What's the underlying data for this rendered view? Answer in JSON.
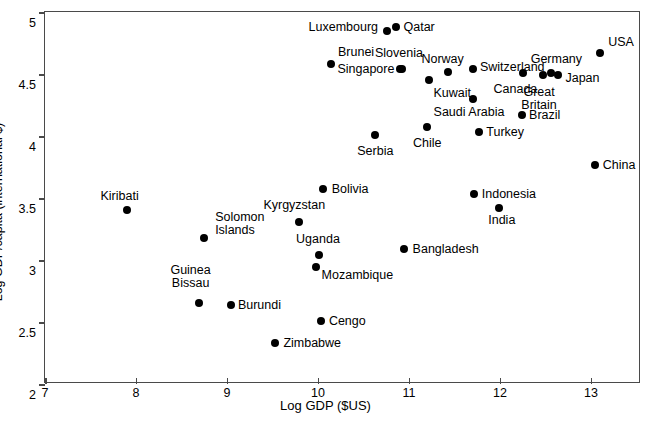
{
  "chart_data": {
    "type": "scatter",
    "title": "",
    "xlabel": "Log GDP ($US)",
    "ylabel": "Log GDP/capita (international $)",
    "xlim": [
      7,
      13.55
    ],
    "ylim": [
      2,
      5
    ],
    "xticks": [
      "7",
      "8",
      "9",
      "10",
      "11",
      "12",
      "13"
    ],
    "xtick_values": [
      7,
      8,
      9,
      10,
      11,
      12,
      13
    ],
    "yticks": [
      "2",
      "2.5",
      "3",
      "3.5",
      "4",
      "4.5",
      "5"
    ],
    "ytick_values": [
      2,
      2.5,
      3,
      3.5,
      4,
      4.5,
      5
    ],
    "grid": false,
    "legend": false,
    "marker_color": "#000000",
    "points": [
      {
        "label": "Kiribati",
        "x": 7.9,
        "y": 3.4,
        "lx": 7.82,
        "ly": 3.52,
        "align": "c"
      },
      {
        "label": "Guinea\nBissau",
        "x": 8.69,
        "y": 2.65,
        "lx": 8.6,
        "ly": 2.86,
        "align": "c"
      },
      {
        "label": "Solomon\nIslands",
        "x": 8.75,
        "y": 3.18,
        "lx": 8.87,
        "ly": 3.29,
        "align": "r"
      },
      {
        "label": "Burundi",
        "x": 9.04,
        "y": 2.64,
        "lx": 9.12,
        "ly": 2.64,
        "align": "r"
      },
      {
        "label": "Zimbabwe",
        "x": 9.53,
        "y": 2.33,
        "lx": 9.62,
        "ly": 2.33,
        "align": "r"
      },
      {
        "label": "Kyrgyzstan",
        "x": 9.79,
        "y": 3.31,
        "lx": 9.74,
        "ly": 3.44,
        "align": "c"
      },
      {
        "label": "Cengo",
        "x": 10.03,
        "y": 2.51,
        "lx": 10.12,
        "ly": 2.51,
        "align": "r"
      },
      {
        "label": "Uganda",
        "x": 10.01,
        "y": 3.04,
        "lx": 10.0,
        "ly": 3.17,
        "align": "c"
      },
      {
        "label": "Mozambique",
        "x": 9.98,
        "y": 2.94,
        "lx": 10.04,
        "ly": 2.88,
        "align": "r"
      },
      {
        "label": "Bolivia",
        "x": 10.06,
        "y": 3.57,
        "lx": 10.15,
        "ly": 3.57,
        "align": "r"
      },
      {
        "label": "Serbia",
        "x": 10.63,
        "y": 4.01,
        "lx": 10.63,
        "ly": 3.88,
        "align": "c"
      },
      {
        "label": "Luxembourg",
        "x": 10.76,
        "y": 4.85,
        "lx": 10.66,
        "ly": 4.88,
        "align": "l"
      },
      {
        "label": "Qatar",
        "x": 10.86,
        "y": 4.88,
        "lx": 10.94,
        "ly": 4.88,
        "align": "r"
      },
      {
        "label": "Brunei",
        "x": 10.14,
        "y": 4.58,
        "lx": 10.22,
        "ly": 4.68,
        "align": "r"
      },
      {
        "label": "Slovenia",
        "x": 10.9,
        "y": 4.54,
        "lx": 10.89,
        "ly": 4.67,
        "align": "c"
      },
      {
        "label": "Singapore",
        "x": 10.92,
        "y": 4.54,
        "lx": 10.84,
        "ly": 4.54,
        "align": "l"
      },
      {
        "label": "Kuwait",
        "x": 11.22,
        "y": 4.45,
        "lx": 11.27,
        "ly": 4.35,
        "align": "r"
      },
      {
        "label": "Norway",
        "x": 11.43,
        "y": 4.52,
        "lx": 11.37,
        "ly": 4.62,
        "align": "c"
      },
      {
        "label": "Chile",
        "x": 11.2,
        "y": 4.07,
        "lx": 11.2,
        "ly": 3.94,
        "align": "c"
      },
      {
        "label": "Switzerland",
        "x": 11.7,
        "y": 4.54,
        "lx": 11.78,
        "ly": 4.56,
        "align": "r"
      },
      {
        "label": "Saudi Arabia",
        "x": 11.7,
        "y": 4.3,
        "lx": 11.66,
        "ly": 4.19,
        "align": "c"
      },
      {
        "label": "Turkey",
        "x": 11.77,
        "y": 4.03,
        "lx": 11.85,
        "ly": 4.03,
        "align": "r"
      },
      {
        "label": "Indonesia",
        "x": 11.71,
        "y": 3.53,
        "lx": 11.8,
        "ly": 3.53,
        "align": "r"
      },
      {
        "label": "India",
        "x": 11.99,
        "y": 3.42,
        "lx": 12.02,
        "ly": 3.32,
        "align": "c"
      },
      {
        "label": "Bangladesh",
        "x": 10.95,
        "y": 3.09,
        "lx": 11.04,
        "ly": 3.09,
        "align": "r"
      },
      {
        "label": "Canada",
        "x": 12.25,
        "y": 4.51,
        "lx": 12.17,
        "ly": 4.38,
        "align": "c"
      },
      {
        "label": "Brazil",
        "x": 12.24,
        "y": 4.17,
        "lx": 12.32,
        "ly": 4.17,
        "align": "r"
      },
      {
        "label": "Great\nBritain",
        "x": 12.47,
        "y": 4.49,
        "lx": 12.43,
        "ly": 4.3,
        "align": "c"
      },
      {
        "label": "Germany",
        "x": 12.56,
        "y": 4.51,
        "lx": 12.62,
        "ly": 4.62,
        "align": "c"
      },
      {
        "label": "Japan",
        "x": 12.64,
        "y": 4.49,
        "lx": 12.72,
        "ly": 4.47,
        "align": "r"
      },
      {
        "label": "China",
        "x": 13.04,
        "y": 3.77,
        "lx": 13.13,
        "ly": 3.77,
        "align": "r"
      },
      {
        "label": "USA",
        "x": 13.1,
        "y": 4.67,
        "lx": 13.19,
        "ly": 4.76,
        "align": "r"
      }
    ]
  }
}
